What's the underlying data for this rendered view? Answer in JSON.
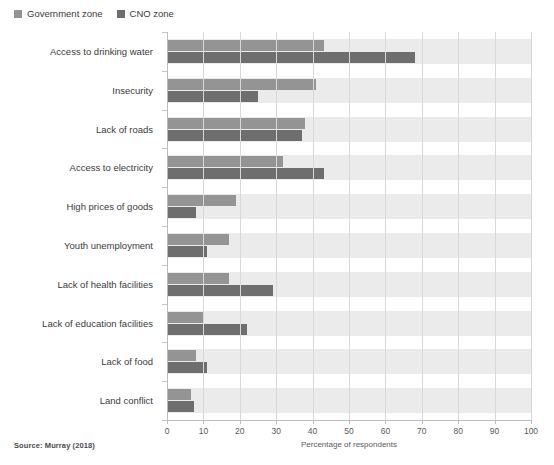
{
  "legend": {
    "items": [
      {
        "label": "Government zone",
        "color": "#949494",
        "key": "government"
      },
      {
        "label": "CNO zone",
        "color": "#6e6e6e",
        "key": "cno"
      }
    ]
  },
  "source_note": "Source: Murray (2018)",
  "chart_data": {
    "type": "bar",
    "orientation": "horizontal",
    "title": "",
    "xlabel": "Percentage of respondents",
    "ylabel": "",
    "xlim": [
      0,
      100
    ],
    "xticks": [
      0,
      10,
      20,
      30,
      40,
      50,
      60,
      70,
      80,
      90,
      100
    ],
    "xtick_labels": [
      "0",
      "10",
      "20",
      "30",
      "40",
      "50",
      "60",
      "70",
      "80",
      "90",
      "100"
    ],
    "grid": "vertical",
    "legend_position": "top-left",
    "categories": [
      "Access to drinking water",
      "Insecurity",
      "Lack of roads",
      "Access to electricity",
      "High prices of goods",
      "Youth unemployment",
      "Lack of health facilities",
      "Lack of education facilities",
      "Lack of food",
      "Land conflict"
    ],
    "series": [
      {
        "name": "Government zone",
        "color": "#949494",
        "values": [
          43,
          41,
          38,
          32,
          19,
          17,
          17,
          10,
          8,
          6.5
        ]
      },
      {
        "name": "CNO zone",
        "color": "#6e6e6e",
        "values": [
          68,
          25,
          37,
          43,
          8,
          11,
          29,
          22,
          11,
          7.5
        ]
      }
    ]
  }
}
